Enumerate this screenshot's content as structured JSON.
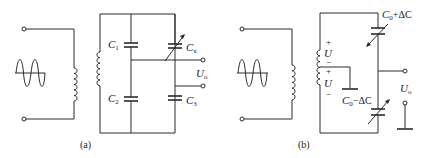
{
  "diagram": {
    "type": "circuit",
    "panels": [
      {
        "id": "a",
        "caption": "(a)",
        "source": "ac-sine-source",
        "components": {
          "c1": {
            "symbol": "C",
            "sub": "1"
          },
          "c2": {
            "symbol": "C",
            "sub": "2"
          },
          "cx": {
            "symbol": "C",
            "sub": "x"
          },
          "c3": {
            "symbol": "C",
            "sub": "3"
          }
        },
        "output": {
          "symbol": "U",
          "sub": "o"
        }
      },
      {
        "id": "b",
        "caption": "(b)",
        "source": "ac-sine-source",
        "components": {
          "c_top": {
            "label": "C₀+ΔC",
            "symbol": "C",
            "sub": "0",
            "rest": "+ΔC"
          },
          "c_bottom": {
            "label": "C₀−ΔC",
            "symbol": "C",
            "sub": "0",
            "rest": "−ΔC"
          }
        },
        "coil_voltages": [
          {
            "plus": "+",
            "symbol": "U",
            "minus": "−"
          },
          {
            "plus": "+",
            "symbol": "U",
            "minus": "−"
          }
        ],
        "output": {
          "symbol": "U",
          "sub": "o"
        }
      }
    ]
  }
}
